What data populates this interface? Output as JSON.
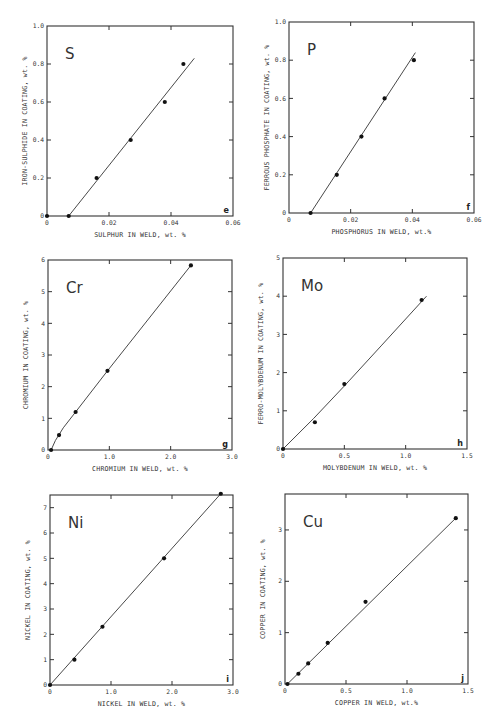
{
  "figure": {
    "panels_count": 6
  },
  "chart_data": [
    {
      "id": "e",
      "type": "scatter",
      "element": "S",
      "panel_label": "e",
      "xlabel": "SULPHUR IN WELD, wt. %",
      "ylabel": "IRON-SULPHIDE IN COATING, wt. %",
      "xlim": [
        0,
        0.06
      ],
      "ylim": [
        0,
        1.0
      ],
      "xticks": [
        0,
        0.02,
        0.04,
        0.06
      ],
      "xtick_labels": [
        "0",
        "0.02",
        "0.04",
        "0.06"
      ],
      "yticks": [
        0,
        0.2,
        0.4,
        0.6,
        0.8,
        1.0
      ],
      "ytick_labels": [
        "0",
        "0.2",
        "0.4",
        "0.6",
        "0.8",
        "1.0"
      ],
      "points": [
        [
          0,
          0
        ],
        [
          0.007,
          0
        ],
        [
          0.016,
          0.2
        ],
        [
          0.027,
          0.4
        ],
        [
          0.038,
          0.6
        ],
        [
          0.044,
          0.8
        ]
      ],
      "fit_line": [
        [
          0.007,
          0
        ],
        [
          0.0475,
          0.83
        ]
      ],
      "frame": {
        "x0": 47,
        "y0": 26,
        "x1": 233,
        "y1": 216
      }
    },
    {
      "id": "f",
      "type": "scatter",
      "element": "P",
      "panel_label": "f",
      "xlabel": "PHOSPHORUS IN WELD, wt.%",
      "ylabel": "FERROUS PHOSPHATE IN COATING, wt. %",
      "xlim": [
        0,
        0.06
      ],
      "ylim": [
        0,
        1.0
      ],
      "xticks": [
        0,
        0.02,
        0.04,
        0.06
      ],
      "xtick_labels": [
        "0",
        "0.02",
        "0.04",
        "0.06"
      ],
      "yticks": [
        0,
        0.2,
        0.4,
        0.6,
        0.8,
        1.0
      ],
      "ytick_labels": [
        "0",
        "0.2",
        "0.4",
        "0.6",
        "0.8",
        "1.0"
      ],
      "points": [
        [
          0.007,
          0
        ],
        [
          0.0155,
          0.2
        ],
        [
          0.0235,
          0.4
        ],
        [
          0.031,
          0.6
        ],
        [
          0.0405,
          0.8
        ]
      ],
      "fit_line": [
        [
          0.007,
          0
        ],
        [
          0.041,
          0.84
        ]
      ],
      "frame": {
        "x0": 289,
        "y0": 22,
        "x1": 474,
        "y1": 213
      }
    },
    {
      "id": "g",
      "type": "scatter",
      "element": "Cr",
      "panel_label": "g",
      "xlabel": "CHROMIUM IN WELD, wt. %",
      "ylabel": "CHROMIUM IN COATING, wt. %",
      "xlim": [
        0,
        3.0
      ],
      "ylim": [
        0,
        6
      ],
      "xticks": [
        0,
        1.0,
        2.0,
        3.0
      ],
      "xtick_labels": [
        "0",
        "1.0",
        "2.0",
        "3.0"
      ],
      "yticks": [
        0,
        1,
        2,
        3,
        4,
        5,
        6
      ],
      "ytick_labels": [
        "0",
        "1",
        "2",
        "3",
        "4",
        "5",
        "6"
      ],
      "points": [
        [
          0.05,
          0
        ],
        [
          0.18,
          0.47
        ],
        [
          0.45,
          1.2
        ],
        [
          0.97,
          2.5
        ],
        [
          2.33,
          5.83
        ]
      ],
      "fit_line": [
        [
          0.05,
          0
        ],
        [
          0.12,
          0.3
        ],
        [
          0.25,
          0.7
        ],
        [
          0.45,
          1.2
        ],
        [
          0.97,
          2.5
        ],
        [
          2.33,
          5.83
        ]
      ],
      "frame": {
        "x0": 48,
        "y0": 260,
        "x1": 232,
        "y1": 450
      }
    },
    {
      "id": "h",
      "type": "scatter",
      "element": "Mo",
      "panel_label": "h",
      "xlabel": "MOLYBDENUM IN WELD, wt. %",
      "ylabel": "FERRO-MOLYBDENUM IN COATING, wt. %",
      "xlim": [
        0,
        1.5
      ],
      "ylim": [
        0,
        5
      ],
      "xticks": [
        0,
        0.5,
        1.0,
        1.5
      ],
      "xtick_labels": [
        "0",
        "0.5",
        "1.0",
        "1.5"
      ],
      "yticks": [
        0,
        1,
        2,
        3,
        4,
        5
      ],
      "ytick_labels": [
        "0",
        "1",
        "2",
        "3",
        "4",
        "5"
      ],
      "points": [
        [
          0,
          0
        ],
        [
          0.26,
          0.7
        ],
        [
          0.5,
          1.7
        ],
        [
          1.13,
          3.9
        ]
      ],
      "fit_line": [
        [
          0,
          0
        ],
        [
          0.25,
          0.8
        ],
        [
          0.5,
          1.65
        ],
        [
          0.8,
          2.7
        ],
        [
          1.17,
          4.0
        ]
      ],
      "frame": {
        "x0": 283,
        "y0": 258,
        "x1": 467,
        "y1": 449
      }
    },
    {
      "id": "i",
      "type": "scatter",
      "element": "Ni",
      "panel_label": "i",
      "xlabel": "NICKEL IN WELD, wt. %",
      "ylabel": "NICKEL IN COATING, wt. %",
      "xlim": [
        0,
        3.0
      ],
      "ylim": [
        0,
        7.5
      ],
      "xticks": [
        0,
        1.0,
        2.0,
        3.0
      ],
      "xtick_labels": [
        "0",
        "1.0",
        "2.0",
        "3.0"
      ],
      "yticks": [
        0,
        1,
        2,
        3,
        4,
        5,
        6,
        7
      ],
      "ytick_labels": [
        "0",
        "1",
        "2",
        "3",
        "4",
        "5",
        "6",
        "7"
      ],
      "points": [
        [
          0,
          0
        ],
        [
          0.4,
          1.0
        ],
        [
          0.86,
          2.3
        ],
        [
          1.87,
          5.0
        ],
        [
          2.8,
          7.55
        ]
      ],
      "fit_line": [
        [
          0,
          0
        ],
        [
          2.8,
          7.55
        ]
      ],
      "frame": {
        "x0": 50,
        "y0": 495,
        "x1": 233,
        "y1": 685
      }
    },
    {
      "id": "j",
      "type": "scatter",
      "element": "Cu",
      "panel_label": "j",
      "xlabel": "COPPER IN WELD, wt.%",
      "ylabel": "COPPER IN COATING, wt. %",
      "xlim": [
        0,
        1.5
      ],
      "ylim": [
        0,
        3.7
      ],
      "xticks": [
        0,
        0.5,
        1.0,
        1.5
      ],
      "xtick_labels": [
        "0",
        "0.5",
        "1.0",
        "1.5"
      ],
      "yticks": [
        0,
        1,
        2,
        3
      ],
      "ytick_labels": [
        "0",
        "1",
        "2",
        "3"
      ],
      "points": [
        [
          0.02,
          0
        ],
        [
          0.11,
          0.2
        ],
        [
          0.19,
          0.4
        ],
        [
          0.35,
          0.8
        ],
        [
          0.66,
          1.6
        ],
        [
          1.4,
          3.23
        ]
      ],
      "fit_line": [
        [
          0.02,
          0
        ],
        [
          1.4,
          3.23
        ]
      ],
      "frame": {
        "x0": 285,
        "y0": 494,
        "x1": 468,
        "y1": 684
      }
    }
  ]
}
